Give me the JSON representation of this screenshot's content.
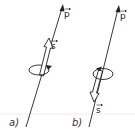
{
  "diagram": {
    "colors": {
      "stroke": "#222222",
      "baseline": "#e6e6e6",
      "background": "#ffffff"
    },
    "panels": [
      {
        "label": "a)",
        "momentum_label": "p",
        "spin_label": "s",
        "spin_direction": "parallel",
        "rotation_arrow": "counterclockwise-right"
      },
      {
        "label": "b)",
        "momentum_label": "p",
        "spin_label": "s",
        "spin_direction": "antiparallel",
        "rotation_arrow": "counterclockwise-left"
      }
    ]
  }
}
